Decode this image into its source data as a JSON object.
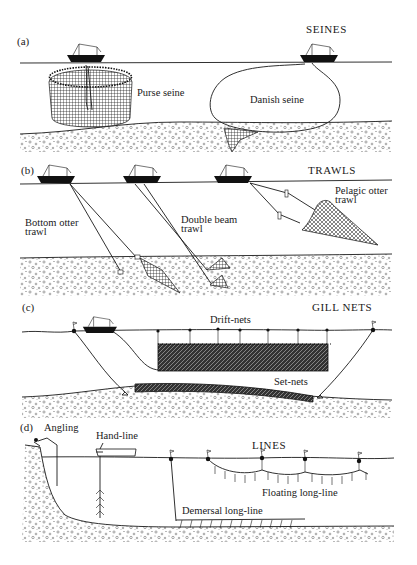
{
  "figure": {
    "colors": {
      "ink": "#1a1a1a",
      "background": "#ffffff",
      "sediment": "#8a8a8a"
    },
    "panels": [
      {
        "id": "a",
        "panel_label": "(a)",
        "category": "SEINES",
        "gear": [
          {
            "name": "purse-seine",
            "label": "Purse seine"
          },
          {
            "name": "danish-seine",
            "label": "Danish seine"
          }
        ]
      },
      {
        "id": "b",
        "panel_label": "(b)",
        "category": "TRAWLS",
        "gear": [
          {
            "name": "bottom-otter-trawl",
            "label_line1": "Bottom  otter",
            "label_line2": "trawl"
          },
          {
            "name": "double-beam-trawl",
            "label_line1": "Double  beam",
            "label_line2": "trawl"
          },
          {
            "name": "pelagic-otter-trawl",
            "label_line1": "Pelagic  otter",
            "label_line2": "trawl"
          }
        ]
      },
      {
        "id": "c",
        "panel_label": "(c)",
        "category": "GILL NETS",
        "gear": [
          {
            "name": "drift-nets",
            "label": "Drift-nets"
          },
          {
            "name": "set-nets",
            "label": "Set-nets"
          }
        ]
      },
      {
        "id": "d",
        "panel_label": "(d)",
        "category": "LINES",
        "gear": [
          {
            "name": "angling",
            "label": "Angling"
          },
          {
            "name": "hand-line",
            "label": "Hand-line"
          },
          {
            "name": "floating-long-line",
            "label": "Floating  long-line"
          },
          {
            "name": "demersal-long-line",
            "label": "Demersal  long-line"
          }
        ]
      }
    ]
  }
}
